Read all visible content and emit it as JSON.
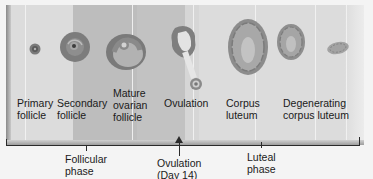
{
  "figure": {
    "stages": [
      {
        "id": "primary",
        "label": "Primary\nfollicle"
      },
      {
        "id": "secondary",
        "label": "Secondary\nfollicle"
      },
      {
        "id": "mature",
        "label": "Mature\novarian\nfollicle"
      },
      {
        "id": "ovulation",
        "label": "Ovulation"
      },
      {
        "id": "corpus",
        "label": "Corpus\nluteum"
      },
      {
        "id": "degenerating",
        "label": "Degenerating\ncorpus luteum"
      }
    ],
    "phases": {
      "follicular": "Follicular\nphase",
      "ovulation": "Ovulation\n(Day 14)",
      "luteal": "Luteal\nphase"
    },
    "colors": {
      "follicle_dark": "#6b6b6b",
      "follicle_mid": "#8c8c8c",
      "luteum": "#9a9a9a",
      "bracket": "#2a2a2a"
    }
  }
}
